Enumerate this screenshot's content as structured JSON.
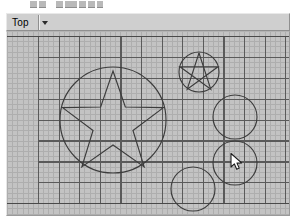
{
  "window": {
    "app_kind": "cad-modeling-viewport"
  },
  "toolbar": {
    "truncated": true,
    "icon_slots": [
      {
        "name": "tool-icon-1",
        "x": 30,
        "w": 7
      },
      {
        "name": "tool-icon-2",
        "x": 39,
        "w": 7
      },
      {
        "name": "tool-icon-3",
        "x": 56,
        "w": 7
      },
      {
        "name": "tool-icon-4",
        "x": 65,
        "w": 12
      },
      {
        "name": "tool-icon-5",
        "x": 79,
        "w": 7
      },
      {
        "name": "tool-icon-6",
        "x": 88,
        "w": 7
      },
      {
        "name": "tool-icon-7",
        "x": 97,
        "w": 6
      }
    ]
  },
  "viewport": {
    "view_label": "Top",
    "dropdown_caret": "chevron-down-icon",
    "bar_bg": "#cfcfcf",
    "canvas_bg": "#c3c3c3",
    "grid": {
      "major_color": "#5a5a5a",
      "minor_color": "#aeaeae",
      "major_step_x": 20.6,
      "major_step_y": 20.9,
      "minor_divisions": 4,
      "origin_x": 31,
      "origin_y": 4,
      "cols": 13,
      "rows": 8,
      "axis_color": "#4a4a4a"
    },
    "geometry_color": "#3c3c3c",
    "shapes": [
      {
        "name": "big-circle",
        "type": "circle",
        "cx": 106,
        "cy": 88,
        "r": 53
      },
      {
        "name": "big-star",
        "type": "star",
        "cx": 106,
        "cy": 92,
        "r_outer": 53,
        "r_inner": 21,
        "points": 5,
        "rotation": -90
      },
      {
        "name": "pentagram-circle",
        "type": "circle",
        "cx": 192,
        "cy": 40,
        "r": 20
      },
      {
        "name": "pentagram-star",
        "type": "pentagram",
        "cx": 192,
        "cy": 41,
        "r": 20,
        "points": 5,
        "rotation": -90
      },
      {
        "name": "circle-right-upper",
        "type": "circle",
        "cx": 228,
        "cy": 85,
        "r": 22
      },
      {
        "name": "circle-right-lower",
        "type": "circle",
        "cx": 228,
        "cy": 131,
        "r": 22
      },
      {
        "name": "circle-bottom",
        "type": "circle",
        "cx": 186,
        "cy": 157,
        "r": 22
      }
    ]
  },
  "pointer": {
    "name": "mouse-cursor",
    "x": 230,
    "y": 128,
    "kind": "arrow"
  }
}
